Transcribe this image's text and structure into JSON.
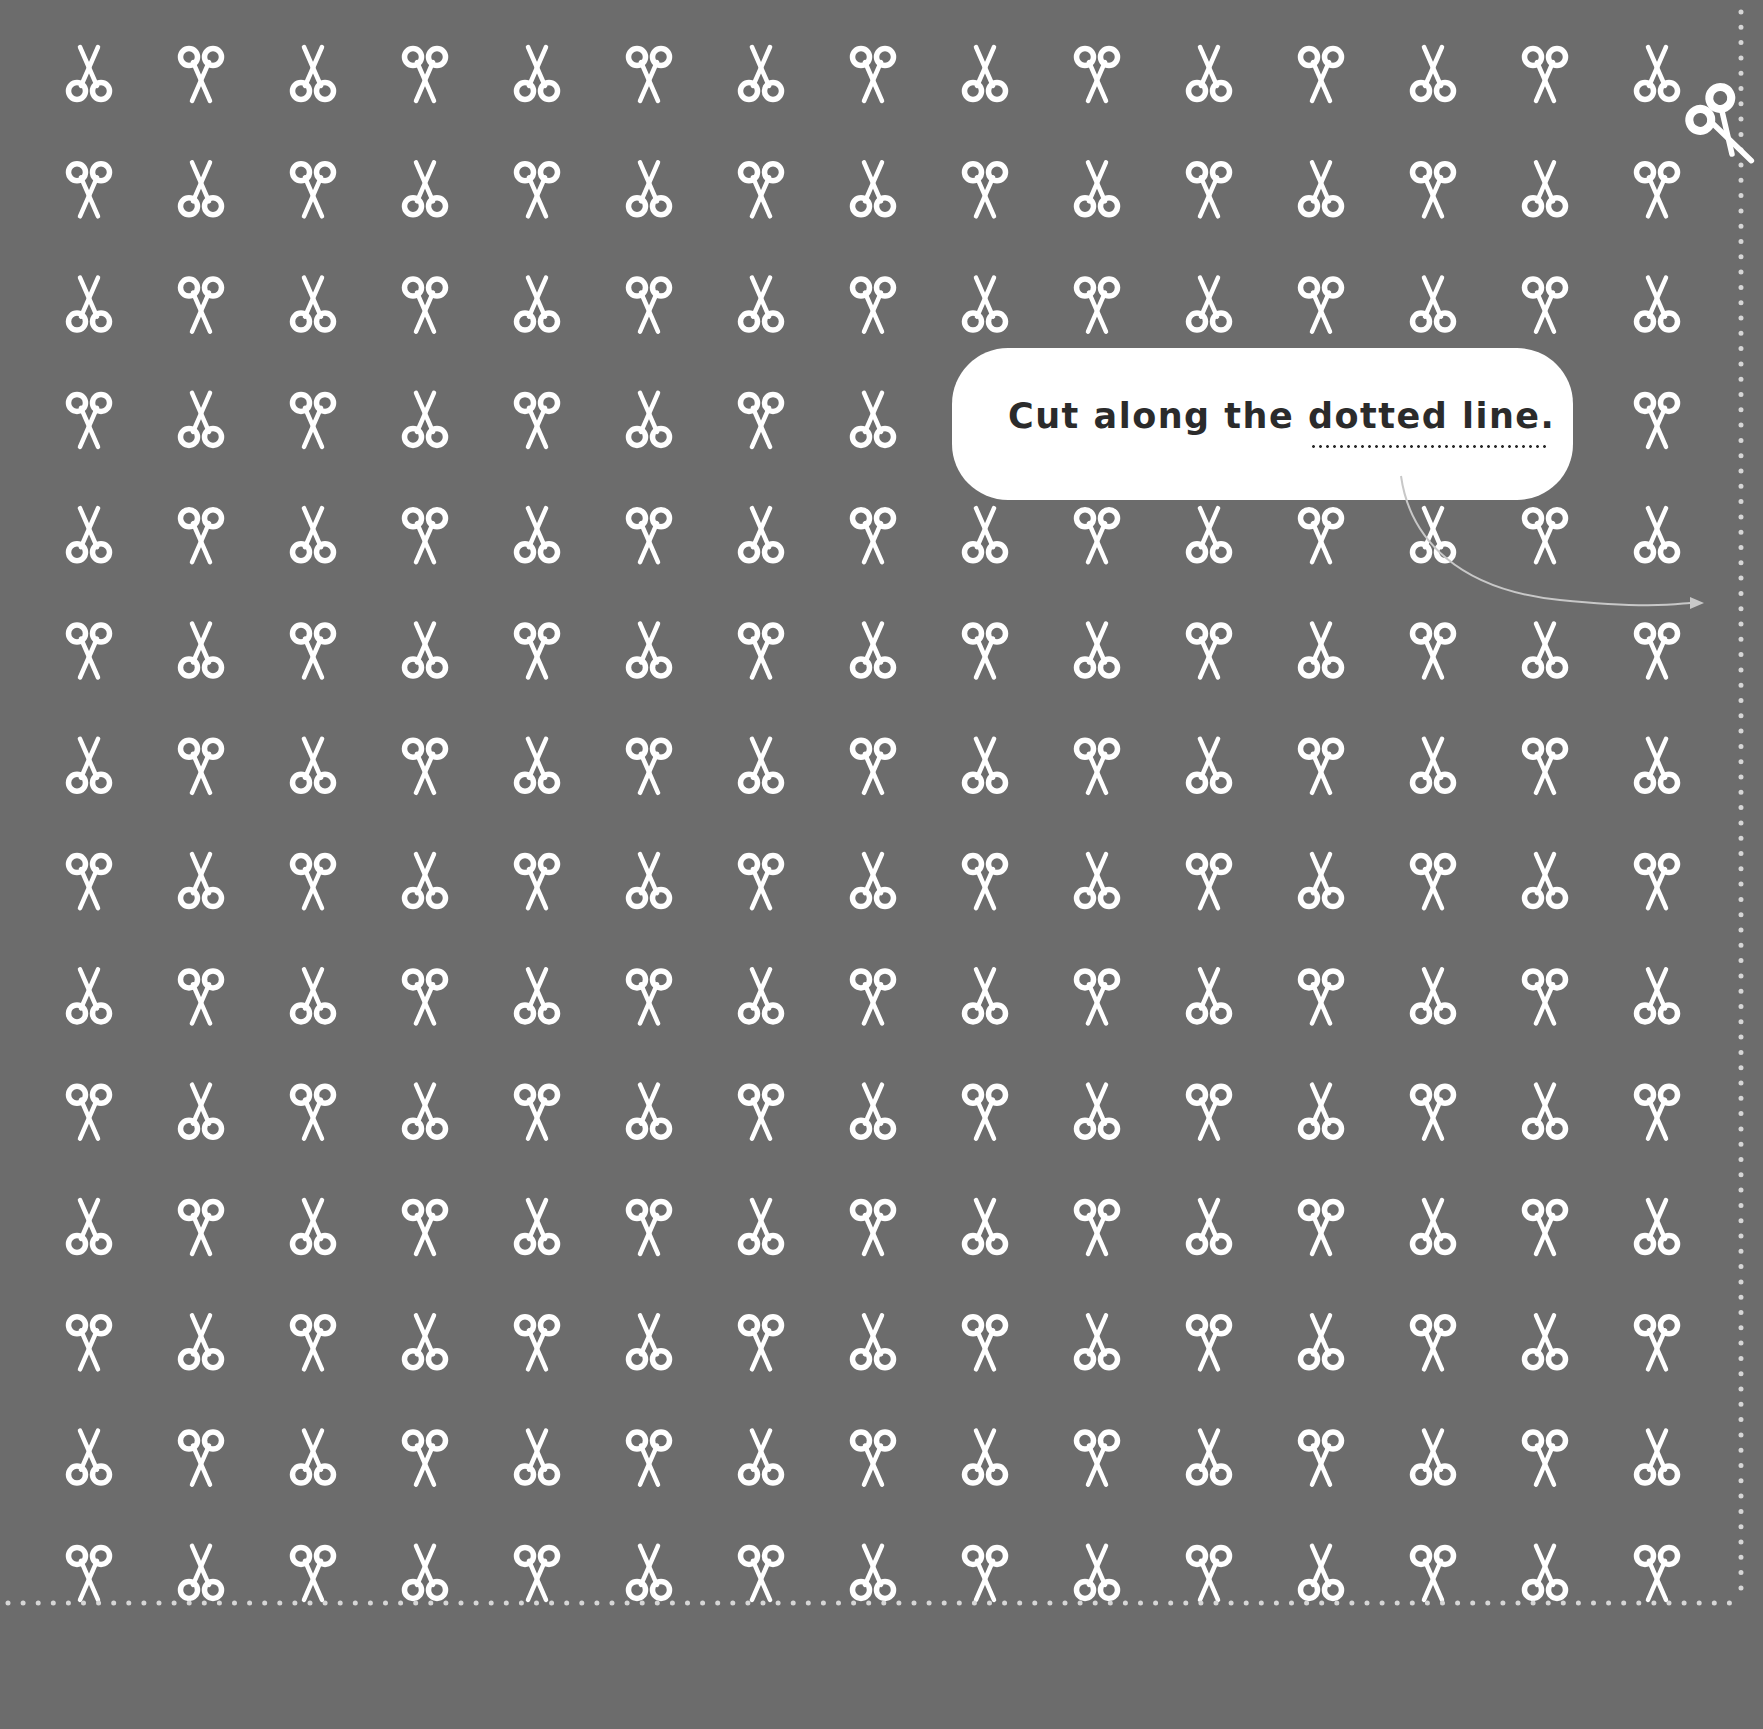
{
  "page": {
    "background_color": "#6c6c6c",
    "foreground_color": "#ffffff"
  },
  "pattern": {
    "icon": "scissors-icon",
    "columns": 15,
    "rows": 14,
    "col_start_x": 89,
    "col_spacing": 112,
    "row_start_y": 74,
    "row_spacing": 115.3,
    "first_cell_orientation": "rings-down",
    "alternation": "checkerboard"
  },
  "callout": {
    "text_before": "Cut along the ",
    "text_emphasis": "dotted line.",
    "bubble_color": "#ffffff",
    "text_color": "#2b2b2b"
  },
  "cut_lines": {
    "vertical_x": 1741,
    "horizontal_y": 1603,
    "dot_color": "#d6d6d6",
    "corner_scissors_icon": "scissors-icon"
  },
  "arrow": {
    "icon": "curved-arrow-icon",
    "color": "#c8c8c8"
  }
}
